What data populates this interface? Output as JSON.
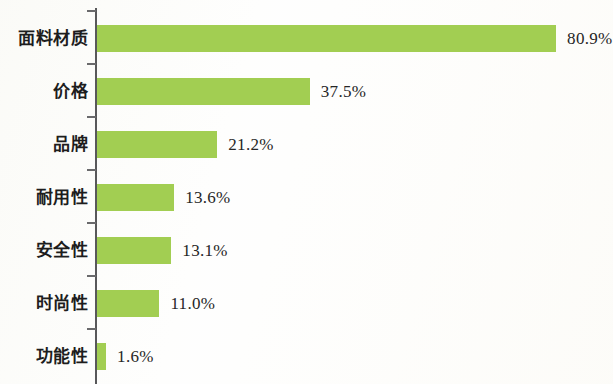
{
  "chart_data": {
    "type": "bar",
    "orientation": "horizontal",
    "title": "",
    "subtitle": "",
    "xlabel": "",
    "ylabel": "",
    "grid": false,
    "legend": null,
    "xlim": [
      0,
      80.9
    ],
    "axis": {
      "y_axis_visible": true,
      "x_axis_visible": false,
      "tick_marks": 7
    },
    "bar_color": "#a2ce52",
    "categories": [
      "面料材质",
      "价格",
      "品牌",
      "耐用性",
      "安全性",
      "时尚性",
      "功能性"
    ],
    "values": [
      80.9,
      37.5,
      21.2,
      13.6,
      13.1,
      11.0,
      1.6
    ],
    "value_labels": [
      "80.9%",
      "37.5%",
      "21.2%",
      "13.6%",
      "13.1%",
      "11.0%",
      "1.6%"
    ]
  },
  "bars": [
    {
      "label": "面料材质",
      "value": 80.9,
      "value_label": "80.9%"
    },
    {
      "label": "价格",
      "value": 37.5,
      "value_label": "37.5%"
    },
    {
      "label": "品牌",
      "value": 21.2,
      "value_label": "21.2%"
    },
    {
      "label": "耐用性",
      "value": 13.6,
      "value_label": "13.6%"
    },
    {
      "label": "安全性",
      "value": 13.1,
      "value_label": "13.1%"
    },
    {
      "label": "时尚性",
      "value": 11.0,
      "value_label": "11.0%"
    },
    {
      "label": "功能性",
      "value": 1.6,
      "value_label": "1.6%"
    }
  ],
  "style": {
    "bar_color": "#a2ce52",
    "axis_color": "#58585a",
    "text_color": "#1d1d1d",
    "background": "#fefefd"
  },
  "layout": {
    "axis_x": 96,
    "bar_start_x": 97,
    "px_per_unit": 5.675,
    "first_bar_top": 25,
    "row_pitch": 53,
    "bar_height": 27,
    "value_gap": 11,
    "tick_offsets": [
      10,
      63,
      116,
      169,
      222,
      275,
      328
    ]
  }
}
